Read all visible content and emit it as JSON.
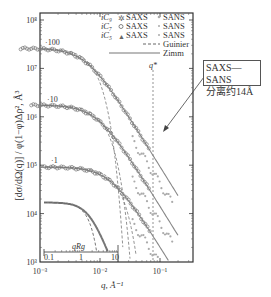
{
  "chart_data": {
    "type": "scatter",
    "title": "",
    "xlabel": "q, Å⁻¹",
    "ylabel": "[dσ/dΩ(q)] / φ(1−φ)Δρ², Å³",
    "xscale": "log",
    "yscale": "log",
    "xlim": [
      0.001,
      0.25
    ],
    "ylim": [
      1000,
      100000000
    ],
    "x_ticks": [
      "10⁻³",
      "10⁻²",
      "10⁻¹"
    ],
    "y_ticks": [
      "10³",
      "10⁴",
      "10⁵",
      "10⁶",
      "10⁷",
      "10⁸"
    ],
    "legend": [
      {
        "label": "iC₉",
        "saxs": "SAXS",
        "sans": "SANS",
        "marker": "star"
      },
      {
        "label": "iC₇",
        "saxs": "SAXS",
        "sans": "SANS",
        "marker": "circle"
      },
      {
        "label": "iC₅",
        "saxs": "SAXS",
        "sans": "SANS",
        "marker": "triangle"
      },
      {
        "label": "Guinier",
        "style": "dashed"
      },
      {
        "label": "Zimm",
        "style": "solid"
      }
    ],
    "curve_offsets": [
      "×100",
      "×10",
      "×1"
    ],
    "series": [
      {
        "name": "iC9 (×100)",
        "plateau": 26000000,
        "knee_q": 0.006,
        "high_q_slope": -2
      },
      {
        "name": "iC7 (×10)",
        "plateau": 1750000,
        "knee_q": 0.009,
        "high_q_slope": -2
      },
      {
        "name": "iC5 (×1)",
        "plateau": 92000,
        "knee_q": 0.015,
        "high_q_slope": -2
      },
      {
        "name": "Zimm vs qRg (inset)",
        "plateau": 17000,
        "qRg_range": [
          0.1,
          10
        ]
      }
    ],
    "annotations": [
      {
        "text": "q*",
        "q": 0.06,
        "style": "dashed vertical line"
      },
      {
        "text": "SAXS—SANS",
        "line2": "分离约14Å"
      },
      {
        "text": "qRg",
        "note": "inset x-axis, 0.1 to 10"
      }
    ],
    "inset_axis": {
      "label": "qR_g",
      "ticks": [
        "0.1",
        "1",
        "10"
      ]
    },
    "grid": false,
    "legend_position": "upper right"
  },
  "labels": {
    "x_axis": "q,  Å⁻¹",
    "y_axis": "[dσ/dΩ(q)]  / φ(1−φ)Δρ²,  Å³",
    "x_tick_1": "10⁻³",
    "x_tick_2": "10⁻²",
    "x_tick_3": "10⁻¹",
    "y_tick_3": "10³",
    "y_tick_4": "10⁴",
    "y_tick_5": "10⁵",
    "y_tick_6": "10⁶",
    "y_tick_7": "10⁷",
    "y_tick_8": "10⁸",
    "offset_100": "·100",
    "offset_10": "·10",
    "offset_1": "·1",
    "legend_ic9": "iC₉",
    "legend_ic7": "iC₇",
    "legend_ic5": "iC₅",
    "saxs": "SAXS",
    "sans": "SANS",
    "guinier": "Guinier",
    "zimm": "Zimm",
    "qstar": "q*",
    "annot_line1": "SAXS—SANS",
    "annot_line2": "分离约14Å",
    "inset_label": "qRg",
    "inset_t1": "0.1",
    "inset_t2": "1",
    "inset_t3": "10"
  }
}
